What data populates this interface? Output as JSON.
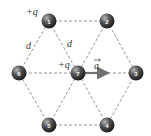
{
  "diagram": {
    "nodes": [
      {
        "id": "1",
        "label": "1",
        "x": 49,
        "y": 21,
        "charge_label": "+q"
      },
      {
        "id": "2",
        "label": "2",
        "x": 107,
        "y": 21
      },
      {
        "id": "3",
        "label": "3",
        "x": 136,
        "y": 73
      },
      {
        "id": "4",
        "label": "4",
        "x": 107,
        "y": 125
      },
      {
        "id": "5",
        "label": "5",
        "x": 49,
        "y": 125
      },
      {
        "id": "6",
        "label": "6",
        "x": 19,
        "y": 73
      },
      {
        "id": "7",
        "label": "7",
        "x": 78,
        "y": 73,
        "charge_label": "+q"
      }
    ],
    "edges": [
      [
        "1",
        "2"
      ],
      [
        "2",
        "3"
      ],
      [
        "3",
        "4"
      ],
      [
        "4",
        "5"
      ],
      [
        "5",
        "6"
      ],
      [
        "6",
        "1"
      ],
      [
        "1",
        "7"
      ],
      [
        "2",
        "7"
      ],
      [
        "3",
        "7"
      ],
      [
        "4",
        "7"
      ],
      [
        "5",
        "7"
      ],
      [
        "6",
        "7"
      ]
    ],
    "labels": {
      "charge_1": "+q",
      "charge_7": "+q",
      "distance_left": "d",
      "distance_right": "d",
      "acceleration": "a"
    },
    "arrow": {
      "from": "7",
      "to_x": 112,
      "to_y": 73,
      "color": "#707070"
    },
    "colors": {
      "sphere_dark": "#2a2a2a",
      "sphere_light": "#9a9a9a",
      "edge": "#7a7a7a",
      "text": "#333333"
    }
  }
}
